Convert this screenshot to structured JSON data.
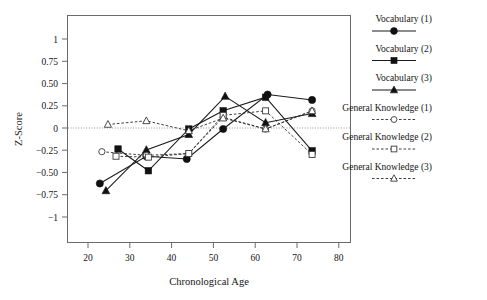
{
  "chart_data": {
    "type": "line",
    "title": "",
    "xlabel": "Chronological Age",
    "ylabel": "Z-Score",
    "xlim": [
      15,
      85
    ],
    "ylim": [
      -1.25,
      1.25
    ],
    "xticks": [
      20,
      30,
      40,
      50,
      60,
      70,
      80
    ],
    "xtick_labels": [
      "20",
      "30",
      "40",
      "50",
      "60",
      "70",
      "80"
    ],
    "yticks": [
      1,
      0.75,
      0.5,
      0.25,
      0,
      -0.25,
      -0.5,
      -0.75,
      -1
    ],
    "ytick_labels": [
      "1",
      "0.75",
      "0.50",
      "0.25",
      "0",
      "−0.25",
      "−0.50",
      "−0.75",
      "−1"
    ],
    "grid": false,
    "zero_reference_line": 0,
    "legend_position": "right",
    "series": [
      {
        "name": "Vocabulary (1)",
        "marker": "filled-circle",
        "line": "solid",
        "x": [
          23,
          34.5,
          44.5,
          53.5,
          64.5,
          75.5
        ],
        "values": [
          -0.6,
          -0.3,
          -0.33,
          0.0,
          0.38,
          0.32
        ]
      },
      {
        "name": "Vocabulary (2)",
        "marker": "filled-square",
        "line": "solid",
        "x": [
          27.5,
          35,
          45,
          53.5,
          64,
          75.5
        ],
        "values": [
          -0.22,
          -0.46,
          0.0,
          0.2,
          0.35,
          -0.24
        ]
      },
      {
        "name": "Vocabulary (3)",
        "marker": "filled-triangle",
        "line": "solid",
        "x": [
          24.5,
          34.5,
          45,
          54,
          64,
          75.5
        ],
        "values": [
          -0.68,
          -0.23,
          -0.06,
          0.36,
          0.07,
          0.17
        ]
      },
      {
        "name": "General Knowledge (1)",
        "marker": "open-circle",
        "line": "dashed",
        "x": [
          23.5,
          34.5,
          45,
          53.5,
          64,
          75.5
        ],
        "values": [
          -0.25,
          -0.29,
          -0.27,
          0.13,
          0.0,
          0.2
        ]
      },
      {
        "name": "General Knowledge (2)",
        "marker": "open-square",
        "line": "dashed",
        "x": [
          27,
          35,
          45,
          53.5,
          64,
          75.5
        ],
        "values": [
          -0.3,
          -0.31,
          -0.27,
          0.15,
          0.2,
          -0.28
        ]
      },
      {
        "name": "General Knowledge (3)",
        "marker": "open-triangle",
        "line": "dashed",
        "x": [
          25,
          34.5,
          45,
          53.5,
          64,
          75.5
        ],
        "values": [
          0.05,
          0.09,
          -0.02,
          0.12,
          0.0,
          0.2
        ]
      }
    ]
  },
  "legend": {
    "entries": [
      {
        "label": "Vocabulary (1)",
        "marker": "filled-circle",
        "line": "solid"
      },
      {
        "label": "Vocabulary (2)",
        "marker": "filled-square",
        "line": "solid"
      },
      {
        "label": "Vocabulary (3)",
        "marker": "filled-triangle",
        "line": "solid"
      },
      {
        "label": "General Knowledge (1)",
        "marker": "open-circle",
        "line": "dashed"
      },
      {
        "label": "General Knowledge (2)",
        "marker": "open-square",
        "line": "dashed"
      },
      {
        "label": "General Knowledge (3)",
        "marker": "open-triangle",
        "line": "dashed"
      }
    ]
  },
  "colors": {
    "background": "#ffffff",
    "ink": "#1a1a1a",
    "frame": "#6b6b6b",
    "zero_line": "#9a9a9a"
  }
}
